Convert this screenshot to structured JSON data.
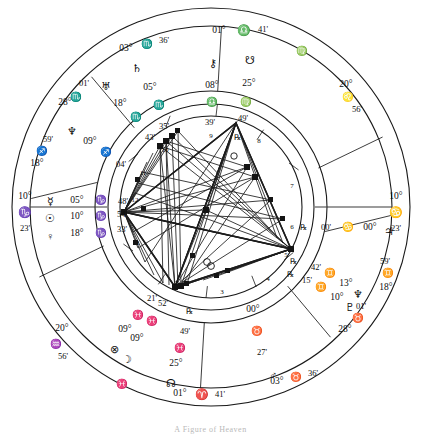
{
  "chart": {
    "type": "astrological-natal-wheel",
    "center": {
      "x": 211,
      "y": 207
    },
    "radii": {
      "outer_ring": 200,
      "ring_inner": 182,
      "sign_band_inner": 118,
      "house_ring_outer": 104,
      "house_ring_inner": 92
    },
    "axes": {
      "mc": {
        "label_deg": "01°",
        "sign": "♎",
        "label_min": "41'",
        "sign_name": "Libra",
        "position": "top"
      },
      "ic": {
        "label_deg": "01°",
        "sign": "♈",
        "label_min": "41'",
        "sign_name": "Aries",
        "position": "bottom"
      },
      "asc": {
        "label_deg": "10°",
        "sign": "♑",
        "label_min": "23'",
        "sign_name": "Capricorn",
        "position": "left"
      },
      "dsc": {
        "label_deg": "10°",
        "sign": "♋",
        "label_min": "23'",
        "sign_name": "Cancer",
        "position": "right"
      }
    },
    "house_cusps": [
      {
        "house": 10,
        "deg": "01°",
        "sign": "♎",
        "min": "41'"
      },
      {
        "house": 11,
        "deg": "03°",
        "sign": "♏",
        "min": "36'"
      },
      {
        "house": 12,
        "deg": "28°",
        "sign": "♏",
        "min": "01'"
      },
      {
        "house": 1,
        "deg": "18°",
        "sign": "♐",
        "min": "59'"
      },
      {
        "house": 2,
        "deg": "10°",
        "sign": "♑",
        "min": "23'"
      },
      {
        "house": 3,
        "deg": "20°",
        "sign": "♒",
        "min": "56'"
      },
      {
        "house": 4,
        "deg": "01°",
        "sign": "♈",
        "min": "41'"
      },
      {
        "house": 5,
        "deg": "03°",
        "sign": "♉",
        "min": "36'"
      },
      {
        "house": 6,
        "deg": "28°",
        "sign": "♉",
        "min": "01'"
      },
      {
        "house": 7,
        "deg": "18°",
        "sign": "♊",
        "min": "59'"
      },
      {
        "house": 8,
        "deg": "10°",
        "sign": "♋",
        "min": "23'"
      },
      {
        "house": 9,
        "deg": "20°",
        "sign": "♌",
        "min": "56'"
      }
    ],
    "house_numbers": [
      "1",
      "2",
      "3",
      "4",
      "5",
      "6",
      "7",
      "8",
      "9",
      "10",
      "11",
      "12"
    ],
    "planets": [
      {
        "name": "Chiron",
        "glyph": "⚷",
        "deg": "08°",
        "sign": "♎",
        "min": "39'",
        "retrograde": false
      },
      {
        "name": "South Node",
        "glyph": "☋",
        "deg": "25°",
        "sign": "♍",
        "min": "49'",
        "retrograde": true
      },
      {
        "name": "Saturn",
        "glyph": "♄",
        "deg": "05°",
        "sign": "♏",
        "min": "35'",
        "retrograde": false
      },
      {
        "name": "Uranus",
        "glyph": "♅",
        "deg": "18°",
        "sign": "♏",
        "min": "43'",
        "retrograde": false
      },
      {
        "name": "Neptune",
        "glyph": "♆",
        "deg": "09°",
        "sign": "♐",
        "min": "04'",
        "retrograde": false
      },
      {
        "name": "Mercury",
        "glyph": "☿",
        "deg": "05°",
        "sign": "♑",
        "min": "48'",
        "retrograde": false
      },
      {
        "name": "Sun",
        "glyph": "☉",
        "deg": "10°",
        "sign": "♑",
        "min": "54'",
        "retrograde": false
      },
      {
        "name": "Venus",
        "glyph": "♀",
        "deg": "18°",
        "sign": "♑",
        "min": "33'",
        "retrograde": false
      },
      {
        "name": "Part of Fortune",
        "glyph": "⊗",
        "deg": "09°",
        "sign": "♓",
        "min": "21'",
        "retrograde": false
      },
      {
        "name": "Moon",
        "glyph": "☽",
        "deg": "09°",
        "sign": "♓",
        "min": "52'",
        "retrograde": false
      },
      {
        "name": "North Node",
        "glyph": "☊",
        "deg": "25°",
        "sign": "♓",
        "min": "49'",
        "retrograde": true
      },
      {
        "name": "Mars",
        "glyph": "♂",
        "deg": "00°",
        "sign": "♉",
        "min": "27'",
        "retrograde": false
      },
      {
        "name": "Pluto",
        "glyph": "♇",
        "deg": "10°",
        "sign": "♊",
        "min": "15'",
        "retrograde": true
      },
      {
        "name": "Neptune-2",
        "glyph": "♆",
        "deg": "13°",
        "sign": "♊",
        "min": "42'",
        "retrograde": true
      },
      {
        "name": "Jupiter",
        "glyph": "♃",
        "deg": "00°",
        "sign": "♋",
        "min": "00'",
        "retrograde": true
      }
    ],
    "labels": {
      "mc_deg": "01°",
      "mc_sign": "♎",
      "mc_min": "41'",
      "ic_deg": "01°",
      "ic_sign": "♈",
      "ic_min": "41'",
      "asc_deg": "10°",
      "asc_sign": "♑",
      "asc_min": "23'",
      "dsc_deg": "10°",
      "dsc_sign": "♋",
      "dsc_min": "23'",
      "c11_deg": "03°",
      "c11_sign": "♏",
      "c11_min": "36'",
      "c12_deg": "28°",
      "c12_sign": "♏",
      "c12_min": "01'",
      "c1_deg": "18°",
      "c1_sign": "♐",
      "c1_min": "59'",
      "c3_deg": "20°",
      "c3_sign": "♒",
      "c3_min": "56'",
      "c5_deg": "03°",
      "c5_sign": "♉",
      "c5_min": "36'",
      "c6_deg": "28°",
      "c6_sign": "♉",
      "c6_min": "01'",
      "c7_deg": "18°",
      "c7_sign": "♊",
      "c7_min": "59'",
      "c9_deg": "20°",
      "c9_sign": "♌",
      "c9_min": "56'",
      "retro": "℞",
      "chiron_glyph": "⚷",
      "chiron_deg": "08°",
      "chiron_sign": "♎",
      "chiron_min": "39'",
      "snode_glyph": "☋",
      "snode_deg": "25°",
      "snode_sign": "♍",
      "snode_min": "49'",
      "saturn_glyph": "♄",
      "saturn_deg": "05°",
      "saturn_sign": "♏",
      "saturn_min": "35'",
      "uranus_glyph": "♅",
      "uranus_deg": "18°",
      "uranus_sign": "♏",
      "uranus_min": "43'",
      "neptune_glyph": "♆",
      "neptune_deg": "09°",
      "neptune_sign": "♐",
      "neptune_min": "04'",
      "mercury_glyph": "☿",
      "mercury_deg": "05°",
      "mercury_sign": "♑",
      "mercury_min": "48'",
      "sun_glyph": "☉",
      "sun_deg": "10°",
      "sun_sign": "♑",
      "sun_min": "54'",
      "venus_glyph": "♀",
      "venus_deg": "18°",
      "venus_sign": "♑",
      "venus_min": "33'",
      "pof_glyph": "⊗",
      "pof_deg": "09°",
      "pof_sign": "♓",
      "pof_min": "21'",
      "moon_glyph": "☽",
      "moon_deg": "09°",
      "moon_sign": "♓",
      "moon_min": "52'",
      "nnode_glyph": "☊",
      "nnode_deg": "25°",
      "nnode_sign": "♓",
      "nnode_min": "49'",
      "mars_glyph": "♂",
      "mars_deg": "00°",
      "mars_sign": "♉",
      "mars_min": "27'",
      "pluto_glyph": "♇",
      "pluto_deg": "10°",
      "pluto_sign": "♊",
      "pluto_min": "15'",
      "neptune2_glyph": "♆",
      "neptune2_deg": "13°",
      "neptune2_sign": "♊",
      "neptune2_min": "42'",
      "jupiter_glyph": "♃",
      "jupiter_deg": "00°",
      "jupiter_sign": "♋",
      "jupiter_min": "00'",
      "h1": "1",
      "h2": "2",
      "h3": "3",
      "h4": "4",
      "h5": "5",
      "h6": "6",
      "h7": "7",
      "h8": "8",
      "h9": "9",
      "h10": "10",
      "h11": "11",
      "h12": "12"
    },
    "caption": "A Figure of Heaven"
  }
}
